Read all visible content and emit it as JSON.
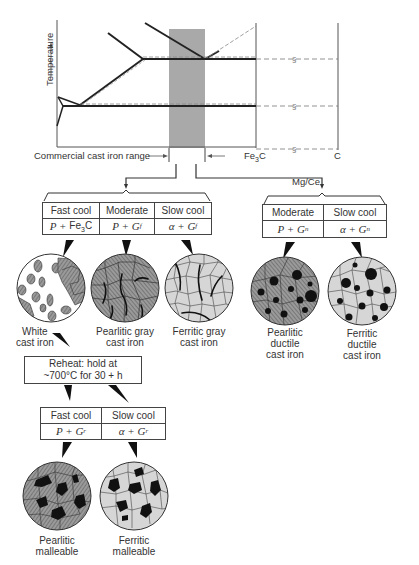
{
  "phase_diagram": {
    "y_axis_label": "Temperature",
    "range_label": "Commercial cast iron range",
    "right_labels": [
      "Fe3C",
      "C"
    ],
    "branch_label_right": "Mg/Ce",
    "colors": {
      "shaded_range": "#a9a9a9",
      "lines": "#222222",
      "dashed": "#666666"
    }
  },
  "gray_white_table": {
    "headers": [
      "Fast cool",
      "Moderate",
      "Slow cool"
    ],
    "phases": [
      "P + Fe3C",
      "P + Gf",
      "α + Gf"
    ]
  },
  "ductile_table": {
    "headers": [
      "Moderate",
      "Slow cool"
    ],
    "phases": [
      "P + Gn",
      "α + Gn"
    ]
  },
  "microstructures_top": [
    {
      "name": "White cast iron",
      "line1": "White",
      "line2": "cast iron"
    },
    {
      "name": "Pearlitic gray cast iron",
      "line1": "Pearlitic gray",
      "line2": "cast iron"
    },
    {
      "name": "Ferritic gray cast iron",
      "line1": "Ferritic gray",
      "line2": "cast iron"
    },
    {
      "name": "Pearlitic ductile cast iron",
      "line1": "Pearlitic",
      "line2": "ductile",
      "line3": "cast iron"
    },
    {
      "name": "Ferritic ductile cast iron",
      "line1": "Ferritic",
      "line2": "ductile",
      "line3": "cast iron"
    }
  ],
  "reheat_box": {
    "line1": "Reheat: hold at",
    "line2": "~700°C for 30 + h"
  },
  "malleable_table": {
    "headers": [
      "Fast cool",
      "Slow cool"
    ],
    "phases": [
      "P + Gr",
      "α + Gr"
    ]
  },
  "microstructures_bottom": [
    {
      "name": "Pearlitic malleable",
      "line1": "Pearlitic",
      "line2": "malleable"
    },
    {
      "name": "Ferritic malleable",
      "line1": "Ferritic",
      "line2": "malleable"
    }
  ]
}
